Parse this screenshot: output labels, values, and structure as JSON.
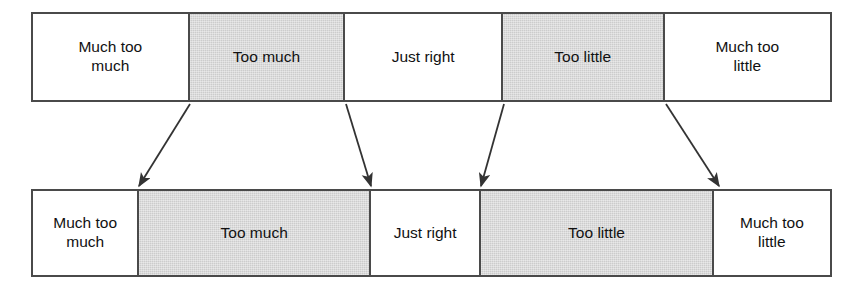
{
  "diagram": {
    "colors": {
      "shaded_fill": "#cccccc",
      "plain_fill": "#ffffff",
      "border": "#4a4a4a",
      "arrow": "#333333",
      "text": "#111111"
    },
    "top_scale": {
      "name": "equal-interval-scale",
      "x": 31,
      "y": 12,
      "width": 801,
      "height": 90,
      "segments": [
        {
          "label": "Much too\nmuch",
          "shaded": false,
          "width_px": 157
        },
        {
          "label": "Too much",
          "shaded": true,
          "width_px": 156
        },
        {
          "label": "Just right",
          "shaded": false,
          "width_px": 158
        },
        {
          "label": "Too little",
          "shaded": true,
          "width_px": 162
        },
        {
          "label": "Much too\nlittle",
          "shaded": false,
          "width_px": 168
        }
      ]
    },
    "bottom_scale": {
      "name": "proportional-scale",
      "x": 31,
      "y": 189,
      "width": 801,
      "height": 88,
      "segments": [
        {
          "label": "Much too\nmuch",
          "shaded": false,
          "width_px": 106
        },
        {
          "label": "Too much",
          "shaded": true,
          "width_px": 233
        },
        {
          "label": "Just right",
          "shaded": false,
          "width_px": 110
        },
        {
          "label": "Too little",
          "shaded": true,
          "width_px": 234
        },
        {
          "label": "Much too\nlittle",
          "shaded": false,
          "width_px": 118
        }
      ]
    },
    "arrows": [
      {
        "name": "arrow-boundary-1",
        "x1": 190,
        "y1": 104,
        "x2": 139,
        "y2": 186
      },
      {
        "name": "arrow-boundary-2",
        "x1": 346,
        "y1": 104,
        "x2": 371,
        "y2": 186
      },
      {
        "name": "arrow-boundary-3",
        "x1": 504,
        "y1": 104,
        "x2": 481,
        "y2": 186
      },
      {
        "name": "arrow-boundary-4",
        "x1": 666,
        "y1": 104,
        "x2": 719,
        "y2": 186
      }
    ]
  }
}
